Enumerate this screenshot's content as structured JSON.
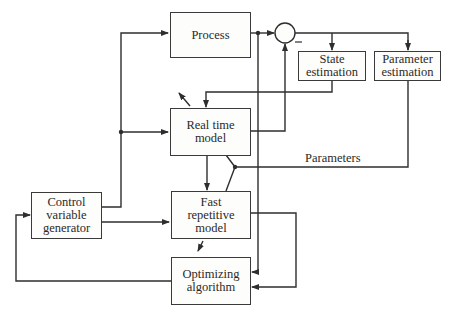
{
  "diagram": {
    "type": "block-diagram",
    "title": "",
    "blocks": [
      {
        "id": "process",
        "label": "Process"
      },
      {
        "id": "state_estimation",
        "label": "State\nestimation"
      },
      {
        "id": "parameter_estimation",
        "label": "Parameter\nestimation"
      },
      {
        "id": "real_time_model",
        "label": "Real time\nmodel"
      },
      {
        "id": "fast_repetitive_model",
        "label": "Fast\nrepetitive\nmodel"
      },
      {
        "id": "control_variable_generator",
        "label": "Control\nvariable\ngenerator"
      },
      {
        "id": "optimizing_algorithm",
        "label": "Optimizing\nalgorithm"
      }
    ],
    "summing_junction": {
      "id": "sum",
      "minus_sign": "–"
    },
    "edge_labels": {
      "parameters": "Parameters"
    },
    "edges": [
      {
        "from": "control_variable_generator",
        "to": "process"
      },
      {
        "from": "control_variable_generator",
        "to": "real_time_model"
      },
      {
        "from": "control_variable_generator",
        "to": "fast_repetitive_model"
      },
      {
        "from": "process",
        "to": "sum",
        "sign": "+"
      },
      {
        "from": "real_time_model",
        "to": "sum",
        "sign": "-"
      },
      {
        "from": "sum",
        "to": "state_estimation"
      },
      {
        "from": "sum",
        "to": "parameter_estimation"
      },
      {
        "from": "state_estimation",
        "to": "real_time_model"
      },
      {
        "from": "parameter_estimation",
        "to": "real_time_model",
        "label": "Parameters"
      },
      {
        "from": "parameter_estimation",
        "to": "fast_repetitive_model",
        "label": "Parameters"
      },
      {
        "from": "real_time_model",
        "to": "fast_repetitive_model"
      },
      {
        "from": "process",
        "to": "optimizing_algorithm"
      },
      {
        "from": "fast_repetitive_model",
        "to": "optimizing_algorithm"
      },
      {
        "from": "optimizing_algorithm",
        "to": "control_variable_generator"
      }
    ]
  }
}
